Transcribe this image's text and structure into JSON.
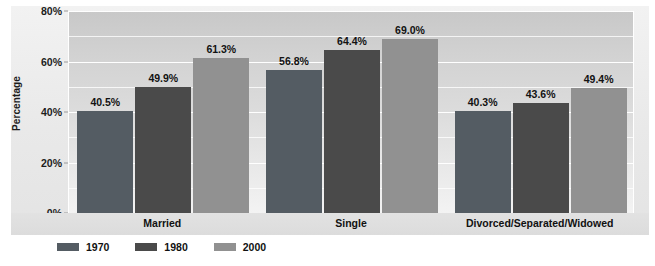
{
  "chart_data": {
    "type": "bar",
    "title": "",
    "subtitle": "",
    "xlabel": "",
    "ylabel": "Percentage",
    "categories": [
      "Married",
      "Single",
      "Divorced/Separated/Widowed"
    ],
    "series": [
      {
        "name": "1970",
        "color": "#545c63",
        "values": [
          40.5,
          56.8,
          40.3
        ],
        "labels": [
          "40.5%",
          "56.8%",
          "40.3%"
        ]
      },
      {
        "name": "1980",
        "color": "#4a4a4a",
        "values": [
          49.9,
          64.4,
          43.6
        ],
        "labels": [
          "49.9%",
          "64.4%",
          "43.6%"
        ]
      },
      {
        "name": "2000",
        "color": "#919191",
        "values": [
          61.3,
          69.0,
          49.4
        ],
        "labels": [
          "61.3%",
          "69.0%",
          "49.4%"
        ]
      }
    ],
    "ylim": [
      0,
      80
    ],
    "y_ticks": [
      0,
      20,
      40,
      60,
      80
    ],
    "y_tick_labels": [
      "0%",
      "20%",
      "40%",
      "60%",
      "80%"
    ],
    "y_minor_step": 10,
    "grid": true,
    "grid_color": "#ffffff",
    "legend_position": "bottom-left",
    "plot_background": "#d8d8d8",
    "figure_background": "#ffffff"
  }
}
